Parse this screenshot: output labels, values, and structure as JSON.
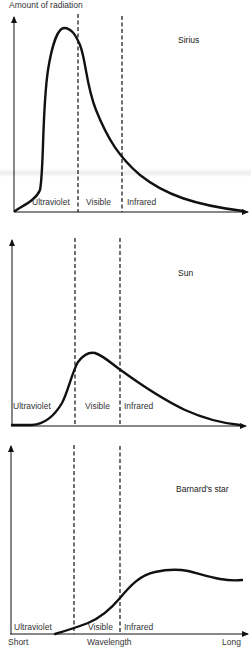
{
  "diagram": {
    "y_axis_label": "Amount of radiation",
    "x_axis_label": "Wavelength",
    "x_axis_start": "Short",
    "x_axis_end": "Long",
    "region_labels": [
      "Ultraviolet",
      "Visible",
      "Infrared"
    ],
    "panels": [
      {
        "star": "Sirius",
        "peak_region": "Ultraviolet",
        "curve_description": "Tall narrow peak in ultraviolet, long tail through visible and infrared"
      },
      {
        "star": "Sun",
        "peak_region": "Visible",
        "curve_description": "Moderate peak within visible band, gradual decline into infrared"
      },
      {
        "star": "Barnard's star",
        "peak_region": "Infrared",
        "curve_description": "Low rise through visible, broad peak in infrared"
      }
    ]
  }
}
